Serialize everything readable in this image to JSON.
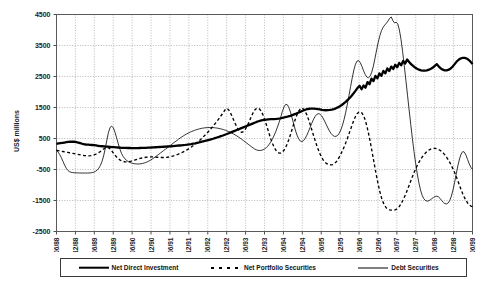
{
  "chart_data": {
    "type": "line",
    "title": "",
    "xlabel": "",
    "ylabel": "US$ millions",
    "ylim": [
      -2500,
      4500
    ],
    "ytick_step": 1000,
    "yticks": [
      4500,
      3500,
      2500,
      1500,
      500,
      -500,
      -1500,
      -2500
    ],
    "ytick_labels": [
      "4500",
      "3500",
      "2500",
      "1500",
      "500",
      "-500",
      "-1500",
      "-2500"
    ],
    "grid": true,
    "legend_position": "bottom",
    "x_tick_labels": [
      "06/88",
      "12/88",
      "06/89",
      "12/89",
      "06/90",
      "12/90",
      "06/91",
      "12/91",
      "06/92",
      "12/92",
      "06/93",
      "12/93",
      "06/94",
      "12/94",
      "06/95",
      "12/95",
      "06/96",
      "12/96",
      "06/97",
      "12/97",
      "06/98",
      "12/98",
      "06/99"
    ],
    "x_tick_interval_months": 6,
    "x_data_start": "06/88",
    "x_data_end": "06/99",
    "series": [
      {
        "name": "Net Direct Investment",
        "style": "thick-solid",
        "color": "#000000",
        "values": [
          330,
          340,
          350,
          360,
          370,
          380,
          390,
          395,
          400,
          395,
          385,
          370,
          350,
          330,
          315,
          305,
          300,
          295,
          290,
          285,
          275,
          265,
          255,
          250,
          245,
          240,
          235,
          230,
          225,
          220,
          215,
          210,
          205,
          200,
          198,
          196,
          194,
          193,
          192,
          191,
          190,
          192,
          194,
          196,
          198,
          200,
          203,
          206,
          210,
          214,
          218,
          222,
          226,
          230,
          234,
          238,
          242,
          246,
          250,
          256,
          262,
          268,
          274,
          280,
          286,
          292,
          300,
          310,
          320,
          332,
          344,
          358,
          372,
          388,
          404,
          420,
          438,
          456,
          474,
          492,
          512,
          532,
          552,
          574,
          596,
          620,
          644,
          670,
          696,
          722,
          748,
          774,
          800,
          826,
          852,
          878,
          904,
          930,
          956,
          982,
          1008,
          1034,
          1056,
          1076,
          1092,
          1104,
          1112,
          1118,
          1122,
          1124,
          1128,
          1134,
          1142,
          1152,
          1164,
          1178,
          1194,
          1212,
          1232,
          1254,
          1278,
          1304,
          1332,
          1360,
          1388,
          1414,
          1436,
          1452,
          1462,
          1466,
          1464,
          1458,
          1448,
          1436,
          1424,
          1416,
          1412,
          1414,
          1420,
          1432,
          1450,
          1474,
          1504,
          1540,
          1582,
          1630,
          1684,
          1744,
          1810,
          1882,
          1960,
          2044,
          2134,
          2200,
          2090,
          2210,
          2140,
          2320,
          2250,
          2430,
          2350,
          2520,
          2440,
          2600,
          2520,
          2680,
          2600,
          2760,
          2680,
          2820,
          2740,
          2880,
          2800,
          2940,
          2860,
          3000,
          2920,
          3050,
          2970,
          2900,
          2840,
          2790,
          2750,
          2720,
          2700,
          2690,
          2690,
          2700,
          2720,
          2750,
          2790,
          2840,
          2900,
          2820,
          2760,
          2720,
          2700,
          2700,
          2720,
          2760,
          2820,
          2900,
          2980,
          3040,
          3080,
          3100,
          3100,
          3080,
          3040,
          2980,
          2900
        ]
      },
      {
        "name": "Net Portfolio Securities",
        "style": "dashed",
        "color": "#000000",
        "values": [
          120,
          110,
          100,
          90,
          80,
          70,
          60,
          50,
          40,
          30,
          20,
          10,
          0,
          -10,
          -20,
          -30,
          -40,
          -50,
          -55,
          -60,
          -60,
          -55,
          -45,
          -30,
          -10,
          15,
          45,
          80,
          120,
          160,
          195,
          215,
          200,
          160,
          100,
          30,
          -40,
          -100,
          -150,
          -190,
          -220,
          -240,
          -250,
          -252,
          -248,
          -240,
          -228,
          -214,
          -198,
          -182,
          -166,
          -150,
          -136,
          -124,
          -114,
          -106,
          -100,
          -96,
          -94,
          -94,
          -96,
          -100,
          -104,
          -108,
          -112,
          -114,
          -114,
          -110,
          -104,
          -96,
          -86,
          -74,
          -60,
          -44,
          -26,
          -6,
          16,
          40,
          66,
          94,
          124,
          156,
          190,
          226,
          264,
          304,
          346,
          390,
          436,
          484,
          534,
          586,
          640,
          696,
          754,
          814,
          876,
          940,
          1006,
          1074,
          1144,
          1216,
          1290,
          1366,
          1444,
          1470,
          1420,
          1330,
          1220,
          1100,
          980,
          870,
          780,
          720,
          700,
          720,
          780,
          870,
          980,
          1100,
          1220,
          1330,
          1420,
          1470,
          1480,
          1450,
          1380,
          1270,
          1130,
          970,
          800,
          630,
          470,
          330,
          210,
          120,
          60,
          30,
          30,
          60,
          120,
          210,
          330,
          470,
          630,
          800,
          970,
          1130,
          1270,
          1380,
          1450,
          1480,
          1450,
          1380,
          1270,
          1130,
          970,
          800,
          630,
          460,
          300,
          150,
          20,
          -90,
          -180,
          -250,
          -300,
          -330,
          -345,
          -350,
          -340,
          -310,
          -260,
          -190,
          -100,
          0,
          110,
          230,
          360,
          500,
          650,
          800,
          950,
          1090,
          1210,
          1300,
          1350,
          1360,
          1320,
          1230,
          1090,
          900,
          670,
          410,
          130,
          -160,
          -450,
          -730,
          -990,
          -1220,
          -1410,
          -1560,
          -1670,
          -1740,
          -1780,
          -1800,
          -1810,
          -1815,
          -1810,
          -1790,
          -1750,
          -1690,
          -1610,
          -1510,
          -1400,
          -1280,
          -1150,
          -1010,
          -870,
          -730,
          -600,
          -480,
          -370,
          -270,
          -180,
          -100,
          -30,
          30,
          80,
          120,
          150,
          170,
          180,
          180,
          170,
          150,
          120,
          80,
          30,
          -30,
          -100,
          -180,
          -270,
          -370,
          -480,
          -600,
          -730,
          -870,
          -1010,
          -1150,
          -1280,
          -1400,
          -1500,
          -1580,
          -1640,
          -1680,
          -1700
        ]
      },
      {
        "name": "Debt Securities",
        "style": "thin-solid",
        "color": "#000000",
        "values": [
          120,
          60,
          -20,
          -120,
          -240,
          -360,
          -460,
          -530,
          -570,
          -590,
          -600,
          -605,
          -608,
          -610,
          -612,
          -613,
          -614,
          -615,
          -615,
          -614,
          -612,
          -608,
          -600,
          -585,
          -560,
          -520,
          -460,
          -370,
          -240,
          -60,
          180,
          450,
          700,
          860,
          900,
          840,
          700,
          520,
          330,
          160,
          20,
          -80,
          -150,
          -200,
          -240,
          -270,
          -290,
          -305,
          -315,
          -320,
          -322,
          -320,
          -314,
          -304,
          -290,
          -272,
          -250,
          -224,
          -194,
          -160,
          -124,
          -86,
          -46,
          -6,
          34,
          74,
          114,
          154,
          194,
          234,
          274,
          314,
          354,
          394,
          434,
          474,
          512,
          548,
          582,
          614,
          644,
          672,
          698,
          722,
          744,
          764,
          782,
          798,
          812,
          824,
          834,
          842,
          848,
          852,
          854,
          854,
          852,
          848,
          842,
          834,
          824,
          812,
          798,
          782,
          764,
          744,
          722,
          698,
          672,
          644,
          614,
          582,
          548,
          512,
          474,
          434,
          394,
          354,
          314,
          274,
          234,
          194,
          160,
          134,
          118,
          112,
          118,
          134,
          160,
          200,
          254,
          322,
          404,
          500,
          610,
          734,
          872,
          1024,
          1190,
          1370,
          1520,
          1600,
          1590,
          1500,
          1350,
          1160,
          960,
          770,
          610,
          490,
          420,
          400,
          430,
          500,
          600,
          720,
          850,
          980,
          1100,
          1200,
          1270,
          1300,
          1290,
          1240,
          1160,
          1060,
          950,
          840,
          740,
          660,
          600,
          570,
          570,
          600,
          670,
          780,
          930,
          1120,
          1350,
          1610,
          1890,
          2180,
          2460,
          2710,
          2900,
          3000,
          3010,
          2940,
          2820,
          2680,
          2560,
          2480,
          2460,
          2510,
          2640,
          2840,
          3090,
          3360,
          3610,
          3820,
          3980,
          4090,
          4160,
          4220,
          4290,
          4380,
          4420,
          4300,
          4230,
          4250,
          4200,
          4000,
          3700,
          3300,
          2850,
          2380,
          1900,
          1420,
          950,
          500,
          80,
          -300,
          -640,
          -930,
          -1160,
          -1330,
          -1440,
          -1500,
          -1520,
          -1510,
          -1480,
          -1440,
          -1400,
          -1370,
          -1360,
          -1380,
          -1430,
          -1500,
          -1560,
          -1600,
          -1610,
          -1580,
          -1500,
          -1360,
          -1160,
          -910,
          -640,
          -380,
          -160,
          0,
          80,
          60,
          -40,
          -180,
          -320,
          -430,
          -500
        ]
      }
    ]
  },
  "legend": {
    "items": [
      {
        "label": "Net Direct Investment",
        "style": "thick-solid"
      },
      {
        "label": "Net Portfolio Securities",
        "style": "dashed"
      },
      {
        "label": "Debt Securities",
        "style": "thin-solid"
      }
    ]
  }
}
